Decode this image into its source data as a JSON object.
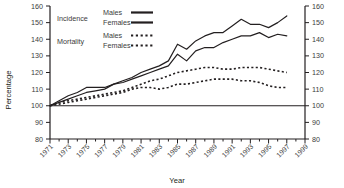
{
  "chart_data": {
    "type": "line",
    "title": "",
    "xlabel": "Year",
    "ylabel": "Percentage",
    "ylim": [
      80,
      160
    ],
    "yticks": [
      80,
      90,
      100,
      110,
      120,
      130,
      140,
      150,
      160
    ],
    "xlim": [
      1971,
      1999
    ],
    "xticks": [
      1971,
      1973,
      1975,
      1977,
      1979,
      1981,
      1983,
      1985,
      1987,
      1989,
      1991,
      1993,
      1995,
      1997,
      1999
    ],
    "grid": false,
    "legend_position": "top-left",
    "right_axis_mirrored": true,
    "reference_line": 100,
    "x": [
      1971,
      1972,
      1973,
      1974,
      1975,
      1976,
      1977,
      1978,
      1979,
      1980,
      1981,
      1982,
      1983,
      1984,
      1985,
      1986,
      1987,
      1988,
      1989,
      1990,
      1991,
      1992,
      1993,
      1994,
      1995,
      1996,
      1997
    ],
    "series": [
      {
        "name": "Incidence Males",
        "group": "Incidence",
        "sex": "Males",
        "style": "solid",
        "color": "#231f20",
        "values": [
          100,
          103,
          106,
          108,
          111,
          111,
          111,
          113,
          115,
          117,
          120,
          122,
          124,
          127,
          137,
          134,
          139,
          142,
          144,
          144,
          148,
          152,
          149,
          149,
          147,
          150,
          154
        ]
      },
      {
        "name": "Incidence Females",
        "group": "Incidence",
        "sex": "Females",
        "style": "solid",
        "color": "#231f20",
        "values": [
          100,
          102,
          104,
          106,
          108,
          109,
          110,
          113,
          114,
          116,
          118,
          120,
          122,
          124,
          131,
          127,
          133,
          135,
          135,
          138,
          140,
          142,
          142,
          144,
          141,
          143,
          142
        ]
      },
      {
        "name": "Mortality Males",
        "group": "Mortality",
        "sex": "Males",
        "style": "dotted",
        "color": "#231f20",
        "values": [
          100,
          102,
          103,
          104,
          105,
          106,
          107,
          108,
          109,
          111,
          113,
          115,
          116,
          118,
          120,
          121,
          122,
          123,
          123,
          122,
          122,
          123,
          123,
          123,
          122,
          121,
          120
        ]
      },
      {
        "name": "Mortality Females",
        "group": "Mortality",
        "sex": "Females",
        "style": "dotted",
        "color": "#231f20",
        "values": [
          100,
          101,
          102,
          103,
          104,
          105,
          106,
          107,
          108,
          110,
          111,
          111,
          110,
          111,
          113,
          113,
          114,
          115,
          116,
          116,
          116,
          115,
          115,
          114,
          112,
          111,
          111
        ]
      }
    ]
  },
  "axes": {
    "ylabel": "Percentage",
    "xlabel": "Year",
    "ytick_labels_left": [
      "160",
      "150",
      "140",
      "130",
      "120",
      "110",
      "100",
      "90",
      "80"
    ],
    "ytick_labels_right": [
      "160",
      "150",
      "140",
      "130",
      "120",
      "110",
      "100",
      "90",
      "80"
    ],
    "xtick_labels": [
      "1971",
      "1973",
      "1975",
      "1977",
      "1979",
      "1981",
      "1983",
      "1985",
      "1987",
      "1989",
      "1991",
      "1993",
      "1995",
      "1997",
      "1999"
    ]
  },
  "legend": {
    "rows": [
      {
        "group": "Incidence",
        "sex": "Males",
        "style": "solid"
      },
      {
        "group": "",
        "sex": "Females",
        "style": "solid"
      },
      {
        "group": "Mortality",
        "sex": "Males",
        "style": "dotted"
      },
      {
        "group": "",
        "sex": "Females",
        "style": "dotted"
      }
    ],
    "group_incidence": "Incidence",
    "group_mortality": "Mortality",
    "males": "Males",
    "females": "Females"
  },
  "colors": {
    "line": "#231f20",
    "axis": "#231f20",
    "text": "#3b3b3b",
    "background": "#ffffff"
  }
}
